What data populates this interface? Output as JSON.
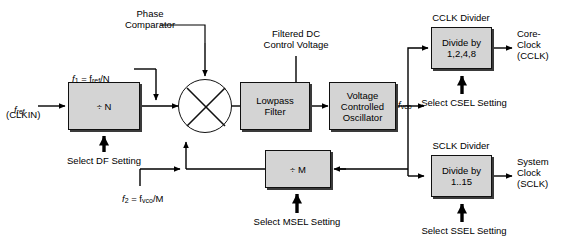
{
  "diagram": {
    "blocks": [
      {
        "id": "divn",
        "label": "÷ N"
      },
      {
        "id": "lpf",
        "label": "Lowpass\nFilter"
      },
      {
        "id": "vco",
        "label": "Voltage\nControlled\nOscillator"
      },
      {
        "id": "divm",
        "label": "÷ M"
      },
      {
        "id": "cclk",
        "label": "Divide by\n1,2,4,8"
      },
      {
        "id": "sclk",
        "label": "Divide by\n1..15"
      }
    ],
    "labels": {
      "phase_comparator": "Phase\nComparator",
      "filtered_dc": "Filtered DC\nControl Voltage",
      "cclk_divider": "CCLK Divider",
      "sclk_divider": "SCLK Divider",
      "f_ref": "f",
      "f_ref_sub": "ref",
      "clkin": "(CLKIN)",
      "f1_pre": "f",
      "f1_sub": "1",
      "f1_mid": " = f",
      "f1_sub2": "ref",
      "f1_post": "/N",
      "f2_pre": "f",
      "f2_sub": "2",
      "f2_mid": " = f",
      "f2_sub2": "vco",
      "f2_post": "/M",
      "f_vco": "f",
      "f_vco_sub": "vco",
      "select_df": "Select DF Setting",
      "select_msel": "Select MSEL Setting",
      "select_csel": "Select CSEL Setting",
      "select_ssel": "Select SSEL Setting",
      "core_clock": "Core-\nClock\n(CCLK)",
      "system_clock": "System\nClock\n(SCLK)"
    },
    "colors": {
      "block_fill": "#d4d4d4",
      "block_stroke": "#111111",
      "wire": "#000000",
      "background": "#ffffff",
      "shadow": "#3a3a3a"
    }
  }
}
